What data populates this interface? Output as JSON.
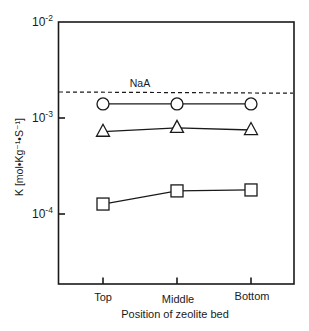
{
  "chart_data": {
    "type": "line",
    "title": "",
    "xlabel": "Position of zeolite bed",
    "ylabel": "K [mol•Kg⁻¹•S⁻¹]",
    "yscale": "log",
    "ylim": [
      1.86e-05,
      0.01
    ],
    "categories": [
      "Top",
      "Middle",
      "Bottom"
    ],
    "y_ticks": [
      {
        "value": 0.01,
        "label_base": "10",
        "label_exp": "-2"
      },
      {
        "value": 0.001,
        "label_base": "10",
        "label_exp": "-3"
      },
      {
        "value": 0.0001,
        "label_base": "10",
        "label_exp": "-4"
      }
    ],
    "grid": false,
    "legend": null,
    "series": [
      {
        "name": "circle-series",
        "marker": "circle",
        "values": [
          0.0014,
          0.0014,
          0.0014
        ]
      },
      {
        "name": "triangle-series",
        "marker": "triangle",
        "values": [
          0.00072,
          0.00079,
          0.00075
        ]
      },
      {
        "name": "square-series",
        "marker": "square",
        "values": [
          0.000127,
          0.000174,
          0.000178
        ]
      }
    ],
    "reference_lines": [
      {
        "label": "NaA",
        "value_start": 0.00187,
        "value_end": 0.00182,
        "style": "dashed"
      }
    ],
    "annotations": [
      {
        "text": "NaA",
        "near": "reference_line"
      }
    ]
  },
  "labels": {
    "xlabel": "Position of zeolite bed",
    "ylabel": "K [mol•Kg⁻¹•S⁻¹]",
    "ref_label": "NaA",
    "cat0": "Top",
    "cat1": "Middle",
    "cat2": "Bottom",
    "ytick0_base": "10",
    "ytick0_exp": "-2",
    "ytick1_base": "10",
    "ytick1_exp": "-3",
    "ytick2_base": "10",
    "ytick2_exp": "-4"
  }
}
